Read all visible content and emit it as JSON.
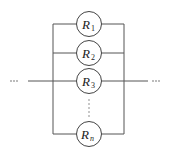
{
  "diagram": {
    "left_ellipsis": "···",
    "right_ellipsis": "···",
    "resistors": [
      {
        "letter": "R",
        "subscript": "1"
      },
      {
        "letter": "R",
        "subscript": "2"
      },
      {
        "letter": "R",
        "subscript": "3"
      },
      {
        "letter": "R",
        "subscript": "n"
      }
    ],
    "colors": {
      "wire": "#555555",
      "stroke": "#444444",
      "text": "#222222"
    }
  }
}
